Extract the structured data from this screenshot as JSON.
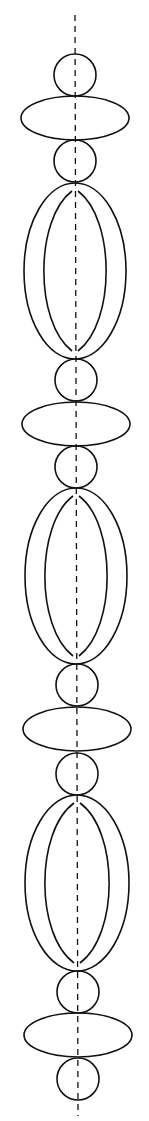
{
  "diagram": {
    "stroke_color": "#111111",
    "background_color": "#ffffff",
    "centerline": {
      "x1": 75,
      "y1": 15,
      "x2": 78,
      "y2": 1116,
      "dash": "6 5"
    },
    "shapes": [
      {
        "kind": "circle",
        "cx": 75,
        "cy": 75,
        "r": 21
      },
      {
        "kind": "ellipse",
        "cx": 75,
        "cy": 118,
        "rx": 54,
        "ry": 22
      },
      {
        "kind": "circle",
        "cx": 75,
        "cy": 161,
        "r": 21
      },
      {
        "kind": "oval",
        "cx": 75,
        "cy": 271,
        "rx": 51,
        "ry": 88,
        "inner_half_width": 30
      },
      {
        "kind": "circle",
        "cx": 76,
        "cy": 380,
        "r": 21
      },
      {
        "kind": "ellipse",
        "cx": 76,
        "cy": 424,
        "rx": 54,
        "ry": 22
      },
      {
        "kind": "circle",
        "cx": 76,
        "cy": 467,
        "r": 21
      },
      {
        "kind": "oval",
        "cx": 76,
        "cy": 576,
        "rx": 51,
        "ry": 88,
        "inner_half_width": 30
      },
      {
        "kind": "circle",
        "cx": 77,
        "cy": 685,
        "r": 21
      },
      {
        "kind": "ellipse",
        "cx": 77,
        "cy": 729,
        "rx": 54,
        "ry": 22
      },
      {
        "kind": "circle",
        "cx": 77,
        "cy": 774,
        "r": 21
      },
      {
        "kind": "oval",
        "cx": 77,
        "cy": 883,
        "rx": 52,
        "ry": 88,
        "inner_half_width": 31
      },
      {
        "kind": "circle",
        "cx": 78,
        "cy": 992,
        "r": 21
      },
      {
        "kind": "ellipse",
        "cx": 78,
        "cy": 1035,
        "rx": 54,
        "ry": 22
      },
      {
        "kind": "circle",
        "cx": 78,
        "cy": 1079,
        "r": 21
      }
    ]
  },
  "labels": {
    "title": "Stacked circles, ellipses and ovals along dashed axis"
  }
}
